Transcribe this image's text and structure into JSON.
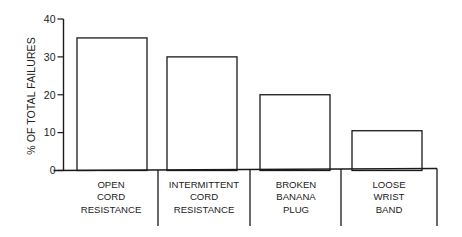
{
  "chart_data": {
    "type": "bar",
    "title": "",
    "xlabel": "",
    "ylabel": "% OF TOTAL FAILURES",
    "ylim": [
      0,
      40
    ],
    "yticks": [
      0,
      10,
      20,
      30,
      40
    ],
    "grid": false,
    "legend": null,
    "categories": [
      [
        "OPEN",
        "CORD",
        "RESISTANCE"
      ],
      [
        "INTERMITTENT",
        "CORD",
        "RESISTANCE"
      ],
      [
        "BROKEN",
        "BANANA",
        "PLUG"
      ],
      [
        "LOOSE",
        "WRIST",
        "BAND"
      ]
    ],
    "category_names": [
      "OPEN CORD RESISTANCE",
      "INTERMITTENT CORD RESISTANCE",
      "BROKEN BANANA PLUG",
      "LOOSE WRIST BAND"
    ],
    "values": [
      35,
      30,
      20,
      10.5
    ],
    "bar_fill": "#ffffff",
    "bar_stroke": "#1a1a1a"
  }
}
